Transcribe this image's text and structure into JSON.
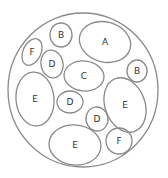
{
  "diagram": {
    "outer": {
      "cx": 83,
      "cy": 90,
      "rx": 75,
      "ry": 77
    },
    "ellipses": [
      {
        "label": "A",
        "cx": 105,
        "cy": 42,
        "rx": 26,
        "ry": 20,
        "rot": 15
      },
      {
        "label": "B",
        "cx": 61,
        "cy": 35,
        "rx": 11,
        "ry": 12,
        "rot": 0
      },
      {
        "label": "F",
        "cx": 32,
        "cy": 52,
        "rx": 9,
        "ry": 14,
        "rot": 25
      },
      {
        "label": "D",
        "cx": 52,
        "cy": 64,
        "rx": 11,
        "ry": 14,
        "rot": -10
      },
      {
        "label": "C",
        "cx": 84,
        "cy": 76,
        "rx": 20,
        "ry": 15,
        "rot": 5
      },
      {
        "label": "B",
        "cx": 137,
        "cy": 71,
        "rx": 10,
        "ry": 11,
        "rot": 0
      },
      {
        "label": "E",
        "cx": 35,
        "cy": 99,
        "rx": 19,
        "ry": 27,
        "rot": -5
      },
      {
        "label": "D",
        "cx": 70,
        "cy": 102,
        "rx": 13,
        "ry": 11,
        "rot": 0
      },
      {
        "label": "E",
        "cx": 125,
        "cy": 105,
        "rx": 20,
        "ry": 28,
        "rot": -20
      },
      {
        "label": "D",
        "cx": 97,
        "cy": 119,
        "rx": 11,
        "ry": 12,
        "rot": -10
      },
      {
        "label": "E",
        "cx": 75,
        "cy": 145,
        "rx": 26,
        "ry": 20,
        "rot": 5
      },
      {
        "label": "F",
        "cx": 119,
        "cy": 141,
        "rx": 13,
        "ry": 13,
        "rot": 0
      }
    ]
  },
  "labels": [
    "A",
    "B",
    "F",
    "D",
    "C",
    "B",
    "E",
    "D",
    "E",
    "D",
    "E",
    "F"
  ]
}
